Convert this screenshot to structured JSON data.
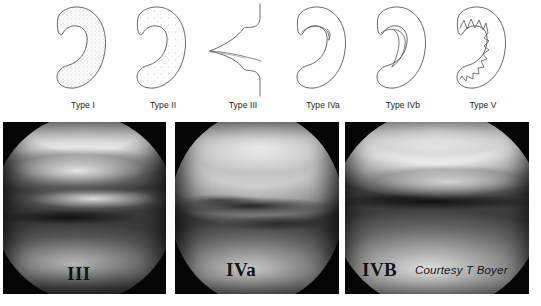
{
  "figure": {
    "background_color": "#ffffff"
  },
  "diagrams": {
    "stroke_color": "#4a4a4a",
    "stipple_color": "#9a9a9a",
    "items": [
      {
        "id": "type-1",
        "label": "Type I",
        "shape": "crescent-stippled-solid",
        "description": "Crescent shaped meniscus, densely stippled",
        "x": 38
      },
      {
        "id": "type-2",
        "label": "Type II",
        "shape": "crescent-stippled-sparse",
        "description": "Crescent shaped meniscus, sparsely stippled",
        "x": 118
      },
      {
        "id": "type-3",
        "label": "Type III",
        "shape": "cross-section-horizontal-cleavage",
        "description": "Cross section with horizontal cleavage tear",
        "x": 198
      },
      {
        "id": "type-4a",
        "label": "Type IVa",
        "shape": "crescent-outline-split",
        "description": "Crescent outline with inner split",
        "x": 278
      },
      {
        "id": "type-4b",
        "label": "Type IVb",
        "shape": "crescent-outline-flap",
        "description": "Crescent outline with displaced flap",
        "x": 358
      },
      {
        "id": "type-5",
        "label": "Type V",
        "shape": "crescent-outline-degenerate",
        "description": "Crescent outline with ragged degenerate inner margin",
        "x": 438
      }
    ]
  },
  "photos": {
    "credit": "Courtesy T Boyer",
    "panels": [
      {
        "id": "photo-panel-iii",
        "caption": "III",
        "x": 3,
        "width": 163,
        "description": "Arthroscopic view of a type III meniscal tear",
        "caption_left": 64,
        "caption_top": 142
      },
      {
        "id": "photo-panel-iva",
        "caption": "IVa",
        "x": 175,
        "width": 164,
        "description": "Arthroscopic view of a type IVa meniscal tear",
        "caption_left": 51,
        "caption_top": 138
      },
      {
        "id": "photo-panel-ivb",
        "caption": "IVB",
        "x": 345,
        "width": 184,
        "description": "Arthroscopic view of a type IVb meniscal tear",
        "caption_left": 17,
        "caption_top": 138
      }
    ]
  }
}
